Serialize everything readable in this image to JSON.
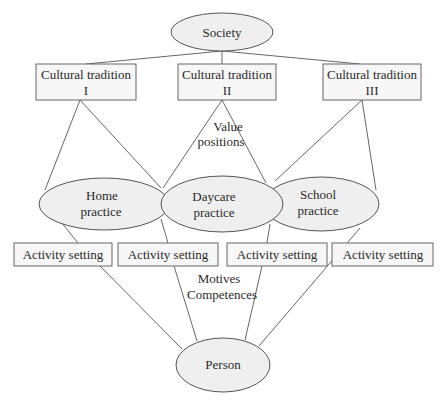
{
  "diagram": {
    "type": "hierarchical concept diagram",
    "nodes": {
      "society": {
        "label": "Society",
        "shape": "ellipse"
      },
      "tradition_1": {
        "line1": "Cultural tradition",
        "line2": "I",
        "shape": "rectangle"
      },
      "tradition_2": {
        "line1": "Cultural tradition",
        "line2": "II",
        "shape": "rectangle"
      },
      "tradition_3": {
        "line1": "Cultural tradition",
        "line2": "III",
        "shape": "rectangle"
      },
      "home": {
        "line1": "Home",
        "line2": "practice",
        "shape": "ellipse"
      },
      "daycare": {
        "line1": "Daycare",
        "line2": "practice",
        "shape": "ellipse"
      },
      "school": {
        "line1": "School",
        "line2": "practice",
        "shape": "ellipse"
      },
      "activity_1": {
        "label": "Activity setting",
        "shape": "rectangle"
      },
      "activity_2": {
        "label": "Activity setting",
        "shape": "rectangle"
      },
      "activity_3": {
        "label": "Activity setting",
        "shape": "rectangle"
      },
      "activity_4": {
        "label": "Activity setting",
        "shape": "rectangle"
      },
      "person": {
        "label": "Person",
        "shape": "ellipse"
      }
    },
    "annotations": {
      "value_positions": {
        "line1": "Value",
        "line2": "positions"
      },
      "motives_competences": {
        "line1": "Motives",
        "line2": "Competences"
      }
    },
    "edges": [
      [
        "society",
        "tradition_1"
      ],
      [
        "society",
        "tradition_2"
      ],
      [
        "society",
        "tradition_3"
      ],
      [
        "tradition_1",
        "home"
      ],
      [
        "tradition_1",
        "daycare"
      ],
      [
        "tradition_2",
        "daycare"
      ],
      [
        "tradition_2",
        "school"
      ],
      [
        "tradition_3",
        "school"
      ],
      [
        "tradition_3",
        "school"
      ],
      [
        "home",
        "activity_1"
      ],
      [
        "daycare",
        "activity_2"
      ],
      [
        "daycare",
        "activity_3"
      ],
      [
        "school",
        "activity_4"
      ],
      [
        "activity_1",
        "person"
      ],
      [
        "activity_2",
        "person"
      ],
      [
        "activity_3",
        "person"
      ],
      [
        "activity_4",
        "person"
      ]
    ],
    "colors": {
      "stroke": "#555555",
      "fill": "#efefef",
      "text": "#2a2a2a",
      "background": "#ffffff"
    }
  }
}
